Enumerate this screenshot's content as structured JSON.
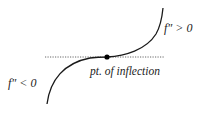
{
  "diagram": {
    "title": "",
    "labels": {
      "upper_region": "f″ > 0",
      "lower_region": "f″ < 0",
      "inflection": "pt. of inflection"
    },
    "colors": {
      "curve": "#1a1a1a",
      "tangent_line": "#555555",
      "point": "#000000",
      "background": "#ffffff"
    }
  }
}
